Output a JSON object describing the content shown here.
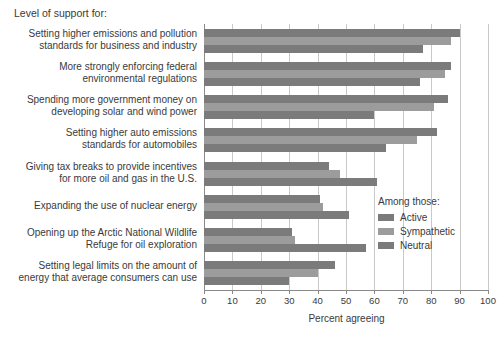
{
  "chart_data": {
    "type": "bar",
    "orientation": "horizontal",
    "title": "Level of support for:",
    "xlabel": "Percent agreeing",
    "ylabel": "",
    "xlim": [
      0,
      100
    ],
    "xticks": [
      0,
      10,
      20,
      30,
      40,
      50,
      60,
      70,
      80,
      90,
      100
    ],
    "grid": true,
    "legend_position": "right-middle",
    "legend_title": "Among those:",
    "categories": [
      "Setting higher emissions and pollution\nstandards for business and industry",
      "More strongly enforcing federal\nenvironmental regulations",
      "Spending more government money on\ndeveloping solar and wind power",
      "Setting higher auto emissions\nstandards for automobiles",
      "Giving tax breaks to provide incentives\nfor more oil and gas in the U.S.",
      "Expanding the use of nuclear energy",
      "Opening up the Arctic National Wildlife\nRefuge for oil exploration",
      "Setting legal limits on the amount of\nenergy that average consumers can use"
    ],
    "series": [
      {
        "name": "Active",
        "color": "#7b7b7b",
        "values": [
          90,
          87,
          86,
          82,
          44,
          41,
          31,
          46
        ]
      },
      {
        "name": "Sympathetic",
        "color": "#9c9c9c",
        "values": [
          87,
          85,
          81,
          75,
          48,
          42,
          32,
          40
        ]
      },
      {
        "name": "Neutral",
        "color": "#7b7b7b",
        "values": [
          77,
          76,
          60,
          64,
          61,
          51,
          57,
          30
        ]
      }
    ]
  },
  "colors": {
    "axis": "#8a8a8a",
    "grid": "#c9c9c9",
    "text": "#3a3a3a",
    "background": "#ffffff"
  }
}
